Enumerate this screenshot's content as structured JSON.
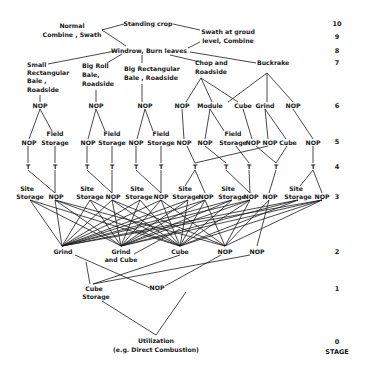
{
  "diagram": {
    "stage_axis": {
      "label": "STAGE",
      "stages": [
        "10",
        "9",
        "8",
        "7",
        "6",
        "5",
        "4",
        "3",
        "2",
        "1",
        "0"
      ]
    },
    "nodes": {
      "standing_crop": "Standing crop",
      "normal_l1": "Normal",
      "normal_l2": "Combine , Swath",
      "swath_l1": "Swath at groud",
      "swath_l2": "level, Combine",
      "windrow": "Windrow, Burn leaves",
      "small_rect_l1": "Small",
      "small_rect_l2": "Rectangular",
      "small_rect_l3": "Bale ,",
      "small_rect_l4": "Roadside",
      "big_roll_l1": "Big Roll",
      "big_roll_l2": "Bale,",
      "big_roll_l3": "Roadside",
      "big_rect_l1": "Big Rectangular",
      "big_rect_l2": "Bale , Roadside",
      "chop_l1": "Chop and",
      "chop_l2": "Roadside",
      "buckrake": "Buckrake",
      "s6": [
        "NOP",
        "NOP",
        "NOP",
        "NOP",
        "Module",
        "Cube",
        "Grind",
        "NOP"
      ],
      "s5_nop": "NOP",
      "s5_field_l1": "Field",
      "s5_field_l2": "Storage",
      "s5_cube": "Cube",
      "s4_t": "T",
      "s3_site_l1": "Site",
      "s3_site_l2": "Storage",
      "s3_nop": "NOP",
      "s2_grind": "Grind",
      "s2_grind_cube_l1": "Grind",
      "s2_grind_cube_l2": "and Cube",
      "s2_cube": "Cube",
      "s2_nop": "NOP",
      "s1_cube_storage_l1": "Cube",
      "s1_cube_storage_l2": "Storage",
      "s1_nop": "NOP",
      "utilization_l1": "Utilization",
      "utilization_l2": "(e.g. Direct Combustion)"
    }
  }
}
